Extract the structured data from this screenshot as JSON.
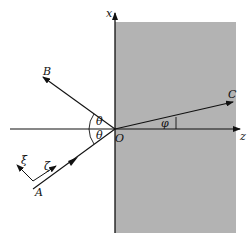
{
  "diagram": {
    "title": "",
    "colors": {
      "background": "#ffffff",
      "medium_shading": "#b3b3b3",
      "lines": "#111111"
    },
    "axes": {
      "vertical_label": "x",
      "horizontal_label": "z",
      "origin_label": "O"
    },
    "rays": {
      "incident_label": "A",
      "reflected_label": "B",
      "transmitted_label": "C"
    },
    "angles": {
      "incidence_label": "θ",
      "reflection_label": "θ",
      "transmission_label": "φ"
    },
    "local_frame": {
      "normal_label": "ξ",
      "tangent_label": "ζ"
    }
  }
}
